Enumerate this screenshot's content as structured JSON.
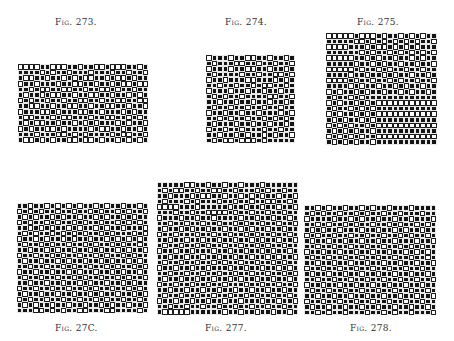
{
  "figures": [
    {
      "id": "fig-273",
      "caption": "Fig. 273.",
      "caption_pos": {
        "x": 55,
        "y": 17
      },
      "grid_pos": {
        "x": 18,
        "y": 64,
        "w": 130,
        "h": 79
      },
      "cols": 24,
      "rows": [
        "000011000110110010001101",
        "111101011011101110110110",
        "100110110101001101001011",
        "011011101100110110100100",
        "110100110011011001011011",
        "101101001101100110110101",
        "010110110110011011001100",
        "110011011001101100110110",
        "011100101110011011101011",
        "100111010011101100110101",
        "101001101101010111010110",
        "010110010111101001101101",
        "111011100101011110100110",
        "100101011001001011010101"
      ]
    },
    {
      "id": "fig-274",
      "caption": "Fig. 274.",
      "caption_pos": {
        "x": 225,
        "y": 17
      },
      "grid_pos": {
        "x": 206,
        "y": 55,
        "w": 89,
        "h": 88
      },
      "cols": 16,
      "rows": [
        "0111011001101101",
        "1011100110110110",
        "0111011001101101",
        "1011110110110010",
        "0110111001110101",
        "1101101101001101",
        "0111011011011011",
        "1010110111100110",
        "1101101101101101",
        "1011011011011011",
        "0110110110111010",
        "1101011011010101",
        "1011101101101101",
        "0110110111011011",
        "1101101011010110",
        "1010010001011111"
      ]
    },
    {
      "id": "fig-275",
      "caption": "Fig. 275.",
      "caption_pos": {
        "x": 357,
        "y": 17
      },
      "grid_pos": {
        "x": 326,
        "y": 33,
        "w": 111,
        "h": 112
      },
      "cols": 20,
      "rows": [
        "00000100010110101011",
        "11111001010101010110",
        "00001110100101010111",
        "11111101011010101010",
        "00000110101101101011",
        "11111011010110110110",
        "00000101101011011011",
        "11110110110101101101",
        "00001011011010110110",
        "11110101101101011011",
        "01011010110110101101",
        "10110101111111111111",
        "01011010100000000000",
        "10110101011111111111",
        "01011010100000000000",
        "10101101011111111111",
        "01010110100000000000",
        "10101011011111111111",
        "01010101100000000000",
        "10101011011111111111"
      ]
    },
    {
      "id": "fig-276",
      "caption": "Fig. 27C.",
      "caption_pos": {
        "x": 55,
        "y": 323
      },
      "grid_pos": {
        "x": 17,
        "y": 203,
        "w": 131,
        "h": 110
      },
      "cols": 24,
      "rows": [
        "110110101010110101101101",
        "010101101101101011010110",
        "101011010110110101101011",
        "010110101101011011010101",
        "110101011010110101101110",
        "101011010101011010111010",
        "011010110101101101010101",
        "101101011011010110101101",
        "110110101101101011010110",
        "011011010110110101101011",
        "101101101011011010110101",
        "110110110101101101011010",
        "011011011010110110101101",
        "101101101101011011010110",
        "110110110110101101101011",
        "011011011011010110110101",
        "101101101101101011011010",
        "010110110110110101101101",
        "101011011011011010110110",
        "111001010110011100111101"
      ]
    },
    {
      "id": "fig-277",
      "caption": "Fig. 277.",
      "caption_pos": {
        "x": 205,
        "y": 323
      },
      "grid_pos": {
        "x": 157,
        "y": 182,
        "w": 141,
        "h": 133
      },
      "cols": 26,
      "rows": [
        "11111001101101101110111111",
        "10100110110011011101011011",
        "11011101001101101010110110",
        "10111010111011011011001101",
        "00001110111110110110110110",
        "11101101100001011011011011",
        "01110110110111101101101101",
        "11011011011011010110110110",
        "10110101101101101011011011",
        "01101110110110110101101101",
        "11011011011011011010110110",
        "10110110101101101101011011",
        "01101101110110110110101101",
        "11011011011011011011010110",
        "10110110110101101101101011",
        "01101101101110110110110101",
        "11011011011011011011011010",
        "10110110110110101101101101",
        "01101101101101110110110110",
        "11011011011011011011011011",
        "10110110110110110101101101",
        "01101101101101101110110110",
        "11011011011011011011011011",
        "10000011111101101101101101"
      ]
    },
    {
      "id": "fig-278",
      "caption": "Fig. 278.",
      "caption_pos": {
        "x": 350,
        "y": 323
      },
      "grid_pos": {
        "x": 304,
        "y": 205,
        "w": 132,
        "h": 110
      },
      "cols": 24,
      "rows": [
        "110101101101011011101111",
        "101011011010110110111011",
        "011110110101101101101110",
        "110101101011011010110101",
        "101011011101101101011011",
        "010110110110110110101101",
        "101101101101101101110110",
        "110110110110110110101011",
        "011011011011011011010101",
        "101101101101101101101101",
        "110110110110110110110110",
        "011011011011011011011011",
        "101101101101101101101101",
        "110110110110110110110110",
        "011011011011011011011011",
        "101101101101101101101101",
        "110110110110110110110110",
        "011011011011011011011011",
        "101101101101101101101101",
        "110101101110110101101110"
      ]
    }
  ],
  "colors": {
    "filled": "#141414",
    "empty": "#ffffff",
    "grid_line": "#1a1a1a",
    "caption": "#333333"
  }
}
